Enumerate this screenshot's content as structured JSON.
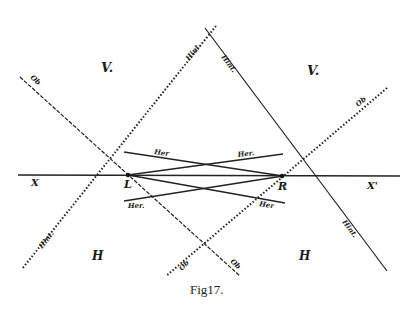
{
  "figure": {
    "caption": "Fig17.",
    "regions": {
      "upper_left": "V.",
      "upper_right": "V.",
      "lower_left": "H",
      "lower_right": "H"
    },
    "points": {
      "left": "L",
      "right": "R"
    },
    "axis": {
      "left": "X",
      "right": "X'"
    },
    "line_labels": {
      "ob_upper_left": "Ob",
      "ob_upper_right": "Ob",
      "ob_lower_left": "Ob",
      "ob_lower_right": "Ob",
      "hint_upper_left": "Hint.",
      "hint_upper_right": "Hint.",
      "hint_lower_left": "Hint.",
      "hint_lower_right": "Hint.",
      "her_upper_left": "Her",
      "her_upper_right": "Her.",
      "her_lower_left": "Her.",
      "her_lower_right": "Her"
    }
  }
}
